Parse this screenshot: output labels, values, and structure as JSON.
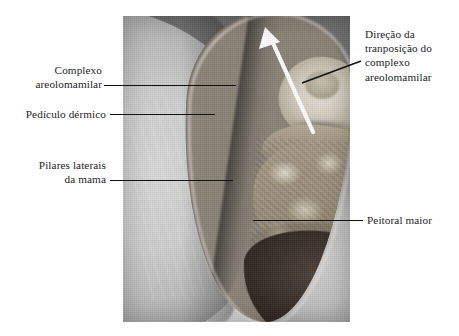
{
  "figure": {
    "type": "annotated-clinical-photograph",
    "language": "pt-BR",
    "background_color": "#ffffff",
    "text_color": "#1d1d1d",
    "leader_line_color": "#111111",
    "arrow_color": "#ffffff",
    "photo": {
      "left": 123,
      "top": 16,
      "width": 227,
      "height": 306,
      "tone": "grayscale"
    }
  },
  "labels": {
    "complexo_areolomamilar": "Complexo\nareolomamilar",
    "pediculo_dermico": "Pedículo dérmico",
    "pilares_laterais": "Pilares laterais\nda mama",
    "direcao_transposicao": "Direção da\ntranposição do\ncomplexo\nareolomamilar",
    "peitoral_maior": "Peitoral maior"
  },
  "annotations": [
    {
      "name": "complexo-areolomamilar",
      "side": "left",
      "leader": {
        "x1": 104,
        "y1": 85,
        "x2": 236,
        "y2": 85
      }
    },
    {
      "name": "pediculo-dermico",
      "side": "left",
      "leader": {
        "x1": 110,
        "y1": 114,
        "x2": 215,
        "y2": 114
      }
    },
    {
      "name": "pilares-laterais",
      "side": "left",
      "leader": {
        "x1": 110,
        "y1": 180,
        "x2": 233,
        "y2": 180
      }
    },
    {
      "name": "direcao-transposicao",
      "side": "right",
      "leader": {
        "x1": 302,
        "y1": 83,
        "x2": 361,
        "y2": 61
      }
    },
    {
      "name": "peitoral-maior",
      "side": "right",
      "leader": {
        "x1": 253,
        "y1": 220,
        "x2": 363,
        "y2": 220
      }
    }
  ],
  "white_arrow": {
    "name": "direction-of-transposition-arrow",
    "from": {
      "x": 190,
      "y": 116
    },
    "to": {
      "x": 143,
      "y": 12
    },
    "color": "#ffffff",
    "meaning": "Direção da tranposição do complexo areolomamilar"
  }
}
